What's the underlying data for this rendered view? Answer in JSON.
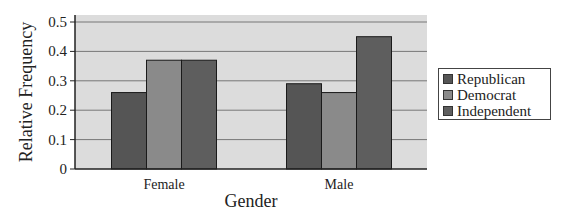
{
  "chart_data": {
    "type": "bar",
    "title": "",
    "xlabel": "Gender",
    "ylabel": "Relative Frequency",
    "categories": [
      "Female",
      "Male"
    ],
    "series": [
      {
        "name": "Republican",
        "values": [
          0.26,
          0.29
        ],
        "color": "#555555"
      },
      {
        "name": "Democrat",
        "values": [
          0.37,
          0.26
        ],
        "color": "#8a8a8a"
      },
      {
        "name": "Independent",
        "values": [
          0.37,
          0.45
        ],
        "color": "#5e5e5e"
      }
    ],
    "ylim": [
      0,
      0.5
    ],
    "yticks": [
      "0",
      "0.1",
      "0.2",
      "0.3",
      "0.4",
      "0.5"
    ],
    "grid": true,
    "legend_position": "right"
  },
  "legend": {
    "items": [
      {
        "label": "Republican",
        "color": "#555555"
      },
      {
        "label": "Democrat",
        "color": "#8a8a8a"
      },
      {
        "label": "Independent",
        "color": "#5e5e5e"
      }
    ]
  }
}
